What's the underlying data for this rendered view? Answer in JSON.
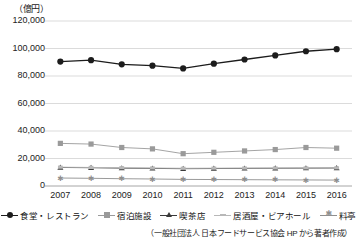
{
  "chart_data": {
    "type": "line",
    "title": "",
    "unit_label": "（億円）",
    "xlabel": "",
    "ylabel": "",
    "ylim": [
      0,
      120000
    ],
    "ytick_step": 20000,
    "yticks": [
      "0",
      "20,000",
      "40,000",
      "60,000",
      "80,000",
      "100,000",
      "120,000"
    ],
    "ytick_values": [
      0,
      20000,
      40000,
      60000,
      80000,
      100000,
      120000
    ],
    "grid": true,
    "legend_position": "bottom",
    "categories": [
      "2007",
      "2008",
      "2009",
      "2010",
      "2011",
      "2012",
      "2013",
      "2014",
      "2015",
      "2016"
    ],
    "series": [
      {
        "name": "食堂・レストラン",
        "marker": "circle",
        "color": "#1c1c1c",
        "values": [
          90500,
          91500,
          88500,
          87500,
          85500,
          89000,
          92000,
          95000,
          98000,
          99500
        ]
      },
      {
        "name": "宿泊施設",
        "marker": "square",
        "color": "#9a9a9a",
        "values": [
          31000,
          30500,
          28000,
          27000,
          23500,
          24500,
          25500,
          26500,
          28000,
          27500
        ]
      },
      {
        "name": "喫茶店",
        "marker": "triangle",
        "color": "#3a3a3a",
        "values": [
          13500,
          13300,
          13000,
          12800,
          12600,
          12700,
          12800,
          12900,
          13000,
          13100
        ]
      },
      {
        "name": "居酒屋・ビアホール",
        "marker": "dash",
        "color": "#b8b8b8",
        "values": [
          13700,
          13500,
          13300,
          13100,
          12900,
          13000,
          13050,
          13100,
          13150,
          13200
        ]
      },
      {
        "name": "料亭",
        "marker": "star",
        "color": "#8f8f8f",
        "values": [
          5800,
          5600,
          5300,
          5100,
          4800,
          4700,
          4600,
          4500,
          4400,
          4300
        ]
      }
    ]
  },
  "source_note": "（一般社団法人 日本フードサービス協会 HP から著者作成）"
}
